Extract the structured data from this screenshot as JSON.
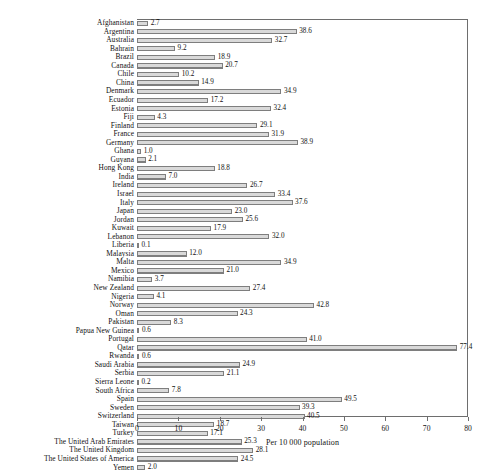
{
  "chart_data": {
    "type": "bar",
    "orientation": "horizontal",
    "title": "",
    "xlabel": "Per 10 000 population",
    "ylabel": "",
    "xlim": [
      0,
      80
    ],
    "xticks": [
      0,
      10,
      20,
      30,
      40,
      50,
      60,
      70,
      80
    ],
    "xtick_labels": [
      "0",
      "10",
      "20",
      "30",
      "40",
      "50",
      "60",
      "70",
      "80"
    ],
    "grid": false,
    "legend": false,
    "show_value_labels": true,
    "categories": [
      "Afghanistan",
      "Argentina",
      "Australia",
      "Bahrain",
      "Brazil",
      "Canada",
      "Chile",
      "China",
      "Denmark",
      "Ecuador",
      "Estonia",
      "Fiji",
      "Finland",
      "France",
      "Germany",
      "Ghana",
      "Guyana",
      "Hong Kong",
      "India",
      "Ireland",
      "Israel",
      "Italy",
      "Japan",
      "Jordan",
      "Kuwait",
      "Lebanon",
      "Liberia",
      "Malaysia",
      "Malta",
      "Mexico",
      "Namibia",
      "New Zealand",
      "Nigeria",
      "Norway",
      "Oman",
      "Pakistan",
      "Papua New Guinea",
      "Portugal",
      "Qatar",
      "Rwanda",
      "Saudi Arabia",
      "Serbia",
      "Sierra Leone",
      "South Africa",
      "Spain",
      "Sweden",
      "Switzerland",
      "Taiwan",
      "Turkey",
      "The United Arab Emirates",
      "The United Kingdom",
      "The United States of America",
      "Yemen"
    ],
    "values": [
      2.7,
      38.6,
      32.7,
      9.2,
      18.9,
      20.7,
      10.2,
      14.9,
      34.9,
      17.2,
      32.4,
      4.3,
      29.1,
      31.9,
      38.9,
      1.0,
      2.1,
      18.8,
      7.0,
      26.7,
      33.4,
      37.6,
      23.0,
      25.6,
      17.9,
      32.0,
      0.1,
      12.0,
      34.9,
      21.0,
      3.7,
      27.4,
      4.1,
      42.8,
      24.3,
      8.3,
      0.6,
      41.0,
      77.4,
      0.6,
      24.9,
      21.1,
      0.2,
      7.8,
      49.5,
      39.3,
      40.5,
      18.7,
      17.1,
      25.3,
      28.1,
      24.5,
      2.0
    ],
    "value_labels": [
      "2.7",
      "38.6",
      "32.7",
      "9.2",
      "18.9",
      "20.7",
      "10.2",
      "14.9",
      "34.9",
      "17.2",
      "32.4",
      "4.3",
      "29.1",
      "31.9",
      "38.9",
      "1.0",
      "2.1",
      "18.8",
      "7.0",
      "26.7",
      "33.4",
      "37.6",
      "23.0",
      "25.6",
      "17.9",
      "32.0",
      "0.1",
      "12.0",
      "34.9",
      "21.0",
      "3.7",
      "27.4",
      "4.1",
      "42.8",
      "24.3",
      "8.3",
      "0.6",
      "41.0",
      "77.4",
      "0.6",
      "24.9",
      "21.1",
      "0.2",
      "7.8",
      "49.5",
      "39.3",
      "40.5",
      "18.7",
      "17.1",
      "25.3",
      "28.1",
      "24.5",
      "2.0"
    ],
    "colors": {
      "bar_fill": "#d9d9d9",
      "bar_edge": "#7e7e7e",
      "axis": "#6e6e6e",
      "text": "#111111",
      "background": "#ffffff"
    }
  }
}
